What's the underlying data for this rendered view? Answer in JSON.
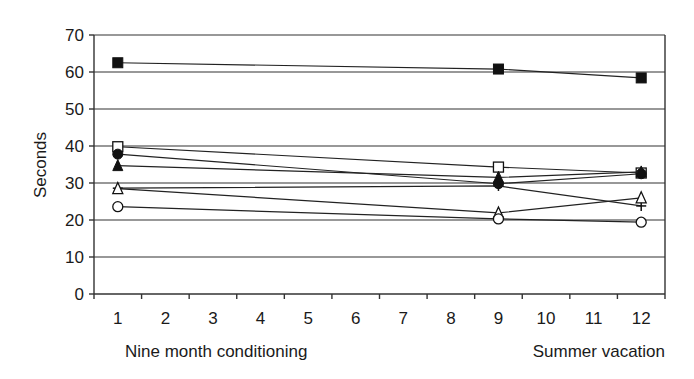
{
  "chart_data": {
    "type": "line",
    "title": "",
    "xlabel_left": "Nine month conditioning",
    "xlabel_right": "Summer vacation",
    "ylabel": "Seconds",
    "categories": [
      "1",
      "2",
      "3",
      "4",
      "5",
      "6",
      "7",
      "8",
      "9",
      "10",
      "11",
      "12"
    ],
    "ylim": [
      0,
      70
    ],
    "yticks": [
      0,
      10,
      20,
      30,
      40,
      50,
      60,
      70
    ],
    "grid": true,
    "legend": "none",
    "series": [
      {
        "name": "filled-square",
        "marker": "square-filled",
        "x": [
          1,
          9,
          12
        ],
        "values": [
          62.5,
          60.8,
          58.4
        ]
      },
      {
        "name": "open-square",
        "marker": "square-open",
        "x": [
          1,
          9,
          12
        ],
        "values": [
          39.8,
          34.3,
          32.7
        ]
      },
      {
        "name": "filled-circle",
        "marker": "circle-filled",
        "x": [
          1,
          9,
          12
        ],
        "values": [
          37.8,
          29.8,
          32.5
        ]
      },
      {
        "name": "filled-triangle",
        "marker": "triangle-filled",
        "x": [
          1,
          9,
          12
        ],
        "values": [
          34.7,
          31.5,
          33.0
        ]
      },
      {
        "name": "dash",
        "marker": "dash",
        "x": [
          1,
          9,
          12
        ],
        "values": [
          28.6,
          29.2,
          23.8
        ]
      },
      {
        "name": "open-triangle",
        "marker": "triangle-open",
        "x": [
          1,
          9,
          12
        ],
        "values": [
          28.5,
          21.9,
          26.0
        ]
      },
      {
        "name": "open-circle",
        "marker": "circle-open",
        "x": [
          1,
          9,
          12
        ],
        "values": [
          23.6,
          20.3,
          19.4
        ]
      }
    ]
  }
}
